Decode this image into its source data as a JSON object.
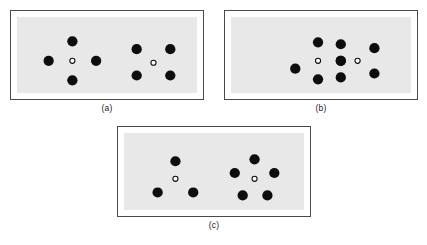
{
  "figure": {
    "background_color": "#ffffff",
    "panel_fill_color": "#e8e8e8",
    "panel_border_color": "#4a4a4a",
    "dot_color": "#0d0d0d",
    "open_circle_fill": "#ffffff",
    "open_circle_stroke": "#0d0d0d",
    "dot_radius": 5.2,
    "open_circle_radius": 2.6,
    "panels": [
      {
        "id": "a",
        "caption": "(a)",
        "width": 194,
        "height": 90,
        "groups": [
          {
            "name": "plus-configuration",
            "center": {
              "x": 56,
              "y": 45
            },
            "open_circle": {
              "x": 56,
              "y": 45
            },
            "dot_count": 4,
            "arrangement": "plus",
            "dots": [
              {
                "x": 56,
                "y": 25
              },
              {
                "x": 32,
                "y": 45
              },
              {
                "x": 80,
                "y": 45
              },
              {
                "x": 56,
                "y": 65
              }
            ]
          },
          {
            "name": "x-configuration",
            "center": {
              "x": 138,
              "y": 47
            },
            "open_circle": {
              "x": 138,
              "y": 47
            },
            "dot_count": 4,
            "arrangement": "cross-diagonal",
            "dots": [
              {
                "x": 121,
                "y": 33
              },
              {
                "x": 155,
                "y": 33
              },
              {
                "x": 121,
                "y": 60
              },
              {
                "x": 155,
                "y": 60
              }
            ]
          }
        ]
      },
      {
        "id": "b",
        "caption": "(b)",
        "width": 194,
        "height": 90,
        "groups": [
          {
            "name": "overlapping-plus-configuration",
            "center": {
              "x": 88,
              "y": 45
            },
            "open_circle": {
              "x": 88,
              "y": 45
            },
            "dot_count": 4,
            "arrangement": "plus",
            "dots": [
              {
                "x": 88,
                "y": 26
              },
              {
                "x": 65,
                "y": 53
              },
              {
                "x": 111,
                "y": 45
              },
              {
                "x": 88,
                "y": 64
              }
            ]
          },
          {
            "name": "overlapping-x-configuration",
            "center": {
              "x": 128,
              "y": 45
            },
            "open_circle": {
              "x": 128,
              "y": 45
            },
            "dot_count": 4,
            "arrangement": "cross-diagonal",
            "dots": [
              {
                "x": 111,
                "y": 28
              },
              {
                "x": 145,
                "y": 32
              },
              {
                "x": 111,
                "y": 62
              },
              {
                "x": 145,
                "y": 58
              }
            ]
          },
          {
            "name": "shared-center-dot",
            "center": {
              "x": 111,
              "y": 45
            },
            "dot_count": 1,
            "arrangement": "single",
            "dots": [
              {
                "x": 111,
                "y": 45
              }
            ]
          }
        ]
      },
      {
        "id": "c",
        "caption": "(c)",
        "width": 194,
        "height": 91,
        "groups": [
          {
            "name": "triangle-configuration",
            "center": {
              "x": 52,
              "y": 47
            },
            "open_circle": {
              "x": 52,
              "y": 47
            },
            "dot_count": 3,
            "arrangement": "triangle",
            "dots": [
              {
                "x": 52,
                "y": 29
              },
              {
                "x": 34,
                "y": 61
              },
              {
                "x": 70,
                "y": 61
              }
            ]
          },
          {
            "name": "pentagon-configuration",
            "center": {
              "x": 132,
              "y": 47
            },
            "open_circle": {
              "x": 132,
              "y": 47
            },
            "dot_count": 5,
            "arrangement": "pentagon",
            "dots": [
              {
                "x": 132,
                "y": 27
              },
              {
                "x": 112,
                "y": 41
              },
              {
                "x": 152,
                "y": 41
              },
              {
                "x": 120,
                "y": 64
              },
              {
                "x": 145,
                "y": 64
              }
            ]
          }
        ]
      }
    ]
  }
}
